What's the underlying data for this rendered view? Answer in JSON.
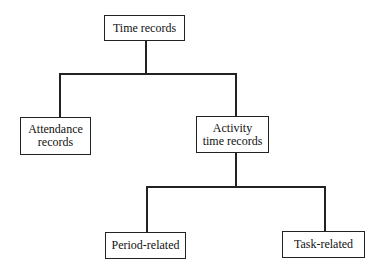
{
  "diagram": {
    "type": "tree",
    "nodes": {
      "root": {
        "label": "Time records"
      },
      "attendance": {
        "label_line1": "Attendance",
        "label_line2": "records"
      },
      "activity": {
        "label_line1": "Activity",
        "label_line2": "time records"
      },
      "period": {
        "label": "Period-related"
      },
      "task": {
        "label": "Task-related"
      }
    },
    "edges": [
      [
        "Time records",
        "Attendance records"
      ],
      [
        "Time records",
        "Activity time records"
      ],
      [
        "Activity time records",
        "Period-related"
      ],
      [
        "Activity time records",
        "Task-related"
      ]
    ]
  }
}
